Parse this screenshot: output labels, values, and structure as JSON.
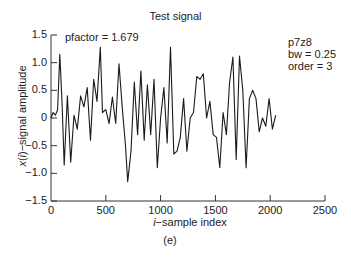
{
  "chart_data": {
    "type": "line",
    "title": "Test signal",
    "xlabel": "i−sample index",
    "ylabel": "x(i)−signal amplitude",
    "caption": "(e)",
    "xlim": [
      0,
      2500
    ],
    "ylim": [
      -1.5,
      1.5
    ],
    "xticks": [
      0,
      500,
      1000,
      1500,
      2000,
      2500
    ],
    "xtick_labels": [
      "0",
      "500",
      "1000",
      "1500",
      "2000",
      "2500"
    ],
    "yticks": [
      1.5,
      1.0,
      0.5,
      0,
      -0.5,
      -1.0,
      -1.5
    ],
    "ytick_labels": [
      "1.5",
      "1.0",
      "0.5",
      "0",
      "−0.5",
      "−1.0",
      "−1.5"
    ],
    "grid": false,
    "annotations": {
      "pfactor": "pfactor = 1.679",
      "name": "p7z8",
      "bw": "bw = 0.25",
      "order": "order = 3"
    },
    "series": [
      {
        "name": "test signal",
        "x": [
          0,
          20,
          40,
          60,
          80,
          100,
          120,
          150,
          180,
          210,
          240,
          270,
          300,
          330,
          360,
          390,
          420,
          450,
          470,
          500,
          530,
          560,
          590,
          620,
          650,
          680,
          700,
          730,
          760,
          790,
          820,
          850,
          880,
          910,
          940,
          970,
          1000,
          1030,
          1060,
          1090,
          1120,
          1150,
          1180,
          1210,
          1240,
          1270,
          1300,
          1330,
          1360,
          1390,
          1420,
          1450,
          1480,
          1510,
          1540,
          1570,
          1600,
          1630,
          1660,
          1690,
          1720,
          1750,
          1780,
          1810,
          1840,
          1870,
          1900,
          1930,
          1960,
          1990,
          2020,
          2050
        ],
        "y": [
          0,
          0.1,
          0.05,
          0.15,
          1.15,
          0.3,
          -0.85,
          0.4,
          -0.8,
          0.05,
          -0.2,
          0.4,
          0.2,
          0.55,
          -0.4,
          0.7,
          0.3,
          1.28,
          0.1,
          0.15,
          -0.1,
          0.38,
          -0.1,
          0.98,
          0.2,
          -0.5,
          -1.15,
          -0.6,
          0.65,
          -0.3,
          0.85,
          -0.4,
          0.6,
          -0.3,
          0.7,
          -0.9,
          0.0,
          0.55,
          -0.45,
          1.28,
          -0.65,
          -0.6,
          -0.35,
          0.35,
          -0.6,
          0.0,
          0.1,
          0.75,
          0.7,
          0.8,
          0.0,
          0.3,
          -0.3,
          -0.35,
          -0.9,
          0.1,
          -0.3,
          0.65,
          1.1,
          -0.75,
          1.12,
          0.5,
          -0.9,
          0.35,
          0.5,
          0.35,
          -0.25,
          0.0,
          -0.15,
          0.35,
          -0.2,
          0.05
        ]
      }
    ]
  }
}
